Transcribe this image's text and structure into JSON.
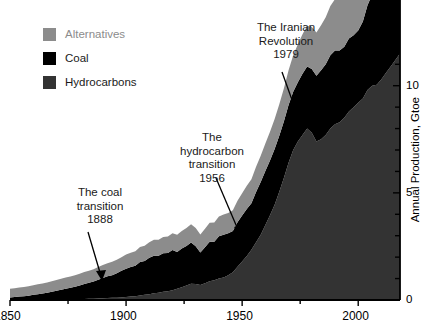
{
  "legend": {
    "items": [
      {
        "label": "Alternatives",
        "color": "#8c8c8c",
        "text_color": "#8c8c8c"
      },
      {
        "label": "Coal",
        "color": "#000000",
        "text_color": "#1a1a1a"
      },
      {
        "label": "Hydrocarbons",
        "color": "#333333",
        "text_color": "#1a1a1a"
      }
    ]
  },
  "annotations": [
    {
      "id": "coal",
      "lines": [
        "The coal",
        "transition",
        "1888"
      ]
    },
    {
      "id": "hydro",
      "lines": [
        "The",
        "hydrocarbon",
        "transition",
        "1956"
      ]
    },
    {
      "id": "iran",
      "lines": [
        "The Iranian",
        "Revolution",
        "1979"
      ]
    }
  ],
  "axes": {
    "x_ticks_major": [
      "1850",
      "1900",
      "1950",
      "2000"
    ],
    "y_ticks_major": [
      "0",
      "5",
      "10"
    ],
    "y_axis_title": "Annual Production, Gtoe"
  },
  "chart_data": {
    "type": "area",
    "title": "",
    "xlabel": "",
    "ylabel": "Annual Production, Gtoe",
    "xlim": [
      1850,
      2018
    ],
    "ylim": [
      0,
      14
    ],
    "xticks_major": [
      1850,
      1900,
      1950,
      2000
    ],
    "xticks_minor_step": 25,
    "yticks_major": [
      0,
      5,
      10
    ],
    "yticks_minor_step": 1,
    "grid": false,
    "legend_position": "upper-left",
    "stacked": true,
    "stack_order_bottom_to_top": [
      "Hydrocarbons",
      "Coal",
      "Alternatives"
    ],
    "x": [
      1850,
      1852,
      1854,
      1856,
      1858,
      1860,
      1862,
      1864,
      1866,
      1868,
      1870,
      1872,
      1874,
      1876,
      1878,
      1880,
      1882,
      1884,
      1886,
      1888,
      1890,
      1892,
      1894,
      1896,
      1898,
      1900,
      1902,
      1904,
      1906,
      1908,
      1910,
      1912,
      1914,
      1916,
      1918,
      1920,
      1922,
      1924,
      1926,
      1928,
      1930,
      1932,
      1934,
      1936,
      1938,
      1940,
      1942,
      1944,
      1946,
      1948,
      1950,
      1952,
      1954,
      1956,
      1958,
      1960,
      1962,
      1964,
      1966,
      1968,
      1970,
      1972,
      1974,
      1976,
      1978,
      1980,
      1982,
      1984,
      1986,
      1988,
      1990,
      1992,
      1994,
      1996,
      1998,
      2000,
      2002,
      2004,
      2006,
      2008,
      2010,
      2012,
      2014,
      2016,
      2018
    ],
    "series": [
      {
        "name": "Hydrocarbons",
        "color": "#333333",
        "values": [
          0.0,
          0.0,
          0.0,
          0.0,
          0.0,
          0.01,
          0.01,
          0.01,
          0.01,
          0.02,
          0.02,
          0.02,
          0.03,
          0.03,
          0.04,
          0.04,
          0.05,
          0.06,
          0.06,
          0.07,
          0.08,
          0.09,
          0.1,
          0.11,
          0.12,
          0.14,
          0.16,
          0.18,
          0.21,
          0.24,
          0.27,
          0.31,
          0.34,
          0.38,
          0.41,
          0.45,
          0.52,
          0.6,
          0.68,
          0.76,
          0.75,
          0.7,
          0.78,
          0.88,
          0.92,
          1.0,
          1.05,
          1.15,
          1.3,
          1.55,
          1.8,
          2.05,
          2.35,
          2.7,
          3.05,
          3.5,
          3.95,
          4.45,
          5.05,
          5.7,
          6.4,
          7.0,
          7.4,
          7.7,
          8.0,
          7.8,
          7.4,
          7.5,
          7.7,
          8.0,
          8.2,
          8.3,
          8.5,
          8.8,
          9.0,
          9.2,
          9.4,
          9.8,
          10.0,
          10.05,
          10.3,
          10.6,
          10.9,
          11.2,
          11.5
        ]
      },
      {
        "name": "Coal",
        "color": "#000000",
        "values": [
          0.12,
          0.14,
          0.16,
          0.18,
          0.2,
          0.23,
          0.26,
          0.29,
          0.33,
          0.37,
          0.41,
          0.46,
          0.5,
          0.54,
          0.58,
          0.64,
          0.7,
          0.74,
          0.8,
          0.88,
          0.95,
          1.02,
          1.06,
          1.14,
          1.24,
          1.32,
          1.38,
          1.42,
          1.56,
          1.58,
          1.7,
          1.76,
          1.72,
          1.8,
          1.78,
          1.88,
          1.72,
          1.8,
          1.84,
          1.92,
          1.76,
          1.52,
          1.68,
          1.84,
          1.8,
          1.98,
          2.0,
          1.96,
          1.92,
          2.08,
          2.14,
          2.2,
          2.16,
          2.34,
          2.46,
          2.52,
          2.56,
          2.6,
          2.62,
          2.64,
          2.7,
          2.72,
          2.76,
          2.86,
          2.9,
          2.98,
          3.06,
          3.22,
          3.3,
          3.42,
          3.44,
          3.34,
          3.32,
          3.4,
          3.36,
          3.38,
          3.6,
          3.95,
          4.25,
          4.5,
          4.8,
          5.05,
          5.2,
          5.0,
          5.0
        ]
      },
      {
        "name": "Alternatives",
        "color": "#8c8c8c",
        "values": [
          0.4,
          0.41,
          0.42,
          0.43,
          0.44,
          0.45,
          0.46,
          0.47,
          0.48,
          0.49,
          0.5,
          0.51,
          0.52,
          0.53,
          0.54,
          0.55,
          0.56,
          0.57,
          0.58,
          0.59,
          0.6,
          0.61,
          0.62,
          0.63,
          0.64,
          0.66,
          0.67,
          0.68,
          0.7,
          0.71,
          0.73,
          0.74,
          0.75,
          0.76,
          0.77,
          0.78,
          0.8,
          0.82,
          0.84,
          0.86,
          0.85,
          0.84,
          0.86,
          0.88,
          0.9,
          0.92,
          0.94,
          0.95,
          0.97,
          1.0,
          1.04,
          1.08,
          1.12,
          1.18,
          1.22,
          1.28,
          1.34,
          1.4,
          1.46,
          1.54,
          1.62,
          1.7,
          1.78,
          1.84,
          1.9,
          1.96,
          2.02,
          2.1,
          2.2,
          2.3,
          2.4,
          2.48,
          2.56,
          2.64,
          2.7,
          2.78,
          2.86,
          2.94,
          3.02,
          3.1,
          3.2,
          3.3,
          3.4,
          3.5,
          3.6
        ]
      }
    ]
  }
}
